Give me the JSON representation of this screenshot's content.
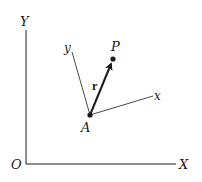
{
  "diagram": {
    "type": "coordinate-frames",
    "colors": {
      "ink": "#1a1a1a",
      "background": "#ffffff"
    },
    "global_frame": {
      "origin_label": "O",
      "x_axis_label": "X",
      "y_axis_label": "Y"
    },
    "local_frame": {
      "origin_label": "A",
      "x_axis_label": "x",
      "y_axis_label": "y"
    },
    "point": {
      "label": "P"
    },
    "vector": {
      "label": "r",
      "from": "A",
      "to": "P"
    }
  }
}
